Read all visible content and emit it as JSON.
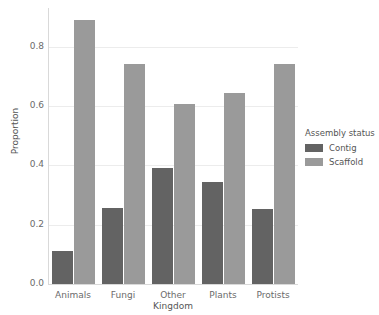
{
  "chart_data": {
    "type": "bar",
    "title": "",
    "xlabel": "Kingdom",
    "ylabel": "Proportion",
    "categories": [
      "Animals",
      "Fungi",
      "Other",
      "Plants",
      "Protists"
    ],
    "series": [
      {
        "name": "Contig",
        "color": "#636363",
        "values": [
          0.11,
          0.255,
          0.39,
          0.345,
          0.253
        ]
      },
      {
        "name": "Scaffold",
        "color": "#9a9a9a",
        "values": [
          0.89,
          0.74,
          0.605,
          0.645,
          0.74
        ]
      }
    ],
    "ylim": [
      0,
      0.93
    ],
    "yticks": [
      0.0,
      0.2,
      0.4,
      0.6,
      0.8
    ],
    "ytick_labels": [
      "0.0",
      "0.2",
      "0.4",
      "0.6",
      "0.8"
    ],
    "grid": true,
    "grid_axis": "y",
    "legend": {
      "title": "Assembly status",
      "position": "right",
      "entries": [
        "Contig",
        "Scaffold"
      ]
    },
    "background": "#ffffff"
  }
}
